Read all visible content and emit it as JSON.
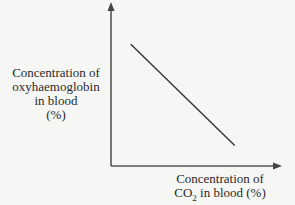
{
  "chart_data": {
    "type": "line",
    "title": "",
    "xlabel": "Concentration of CO2 in blood (%)",
    "ylabel": "Concentration of oxyhaemoglobin in blood (%)",
    "ylabel_lines": [
      "Concentration of",
      "oxyhaemoglobin",
      "in blood",
      "(%)"
    ],
    "xlabel_lines": {
      "line1": "Concentration of",
      "line2_pre": "CO",
      "line2_sub": "2",
      "line2_post": " in blood (%)"
    },
    "xlim": [
      0,
      1
    ],
    "ylim": [
      0,
      1
    ],
    "grid": false,
    "ticks": "none",
    "series": [
      {
        "name": "oxyhaemoglobin vs CO2",
        "x": [
          0.12,
          0.75
        ],
        "y": [
          0.77,
          0.13
        ]
      }
    ],
    "colors": {
      "axis": "#555555",
      "line": "#333333"
    }
  }
}
